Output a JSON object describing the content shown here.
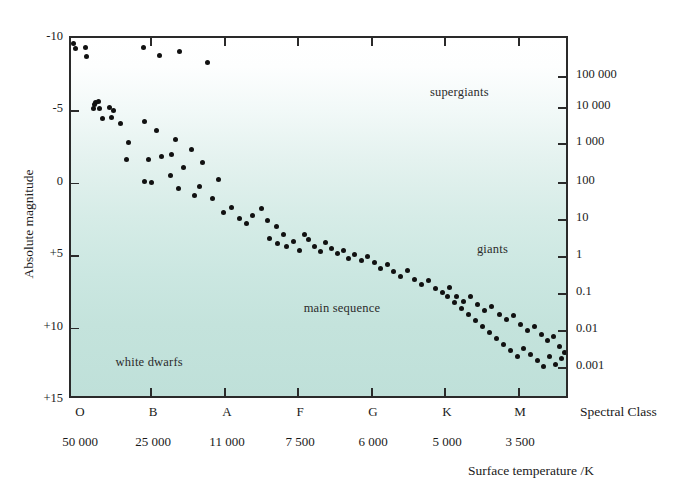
{
  "chart_data": {
    "type": "scatter",
    "xlabel": "Surface temperature /K",
    "x_secondary_label": "Spectral Class",
    "ylabel": "Absolute magnitude",
    "y_secondary_label": "Luminosity relative to the Sun ( × 3.9 × 10²⁶ W)",
    "ylim": [
      -10,
      15
    ],
    "y_axis_inverted": true,
    "grid": false,
    "legend": "none",
    "y_ticks_left": [
      "-10",
      "-5",
      "0",
      "+5",
      "+10",
      "+15"
    ],
    "y_tick_values_left": [
      -10,
      -5,
      0,
      5,
      10,
      15
    ],
    "y_ticks_right": [
      "100 000",
      "10 000",
      "1 000",
      "100",
      "10",
      "1",
      "0.1",
      "0.01",
      "0.001"
    ],
    "y_tick_values_right": [
      100000,
      10000,
      1000,
      100,
      10,
      1,
      0.1,
      0.01,
      0.001
    ],
    "x_ticks_spectral": [
      "O",
      "B",
      "A",
      "F",
      "G",
      "K",
      "M"
    ],
    "x_ticks_temperature": [
      "50 000",
      "25 000",
      "11 000",
      "7 500",
      "6 000",
      "5 000",
      "3 500"
    ],
    "x_tick_temperature_values": [
      50000,
      25000,
      11000,
      7500,
      6000,
      5000,
      3500
    ],
    "annotations": [
      {
        "id": "supergiants",
        "text": "supergiants",
        "x_pct": 72.5,
        "y_pct": 13.0
      },
      {
        "id": "giants",
        "text": "giants",
        "x_pct": 82.0,
        "y_pct": 57.0
      },
      {
        "id": "main-sequence",
        "text": "main sequence",
        "x_pct": 47.0,
        "y_pct": 73.5
      },
      {
        "id": "white-dwarfs",
        "text": "white dwarfs",
        "x_pct": 9.0,
        "y_pct": 88.5
      }
    ],
    "colors": {
      "point": "#111111",
      "frame": "#2a2a2a",
      "background_top": "#ffffff",
      "background_bottom": "#bfe0d9",
      "text": "#1a1a1a"
    },
    "points": [
      [
        1.6,
        5.6
      ],
      [
        4.2,
        10.4
      ],
      [
        14.0,
        9.5
      ],
      [
        15.4,
        18.5
      ],
      [
        72.2,
        9.9
      ],
      [
        88.0,
        17.0
      ],
      [
        108.5,
        13.2
      ],
      [
        136.5,
        24.8
      ],
      [
        24.3,
        64.1
      ],
      [
        22.8,
        70.2
      ],
      [
        28.0,
        70.0
      ],
      [
        23.6,
        66.5
      ],
      [
        27.6,
        63.6
      ],
      [
        38.0,
        69.0
      ],
      [
        42.0,
        72.5
      ],
      [
        31.0,
        80.0
      ],
      [
        40.0,
        79.8
      ],
      [
        49.5,
        85.6
      ],
      [
        73.0,
        83.5
      ],
      [
        85.5,
        92.0
      ],
      [
        104.0,
        101.5
      ],
      [
        100.0,
        116.0
      ],
      [
        57.5,
        104.0
      ],
      [
        55.2,
        121.3
      ],
      [
        77.0,
        121.0
      ],
      [
        90.0,
        118.0
      ],
      [
        120.5,
        111.0
      ],
      [
        131.5,
        124.0
      ],
      [
        112.0,
        129.0
      ],
      [
        99.0,
        137.5
      ],
      [
        80.0,
        144.0
      ],
      [
        73.0,
        143.0
      ],
      [
        107.0,
        150.0
      ],
      [
        123.0,
        157.0
      ],
      [
        128.0,
        148.5
      ],
      [
        147.0,
        141.5
      ],
      [
        141.0,
        160.5
      ],
      [
        152.0,
        174.0
      ],
      [
        160.0,
        169.0
      ],
      [
        168.0,
        180.0
      ],
      [
        175.0,
        185.0
      ],
      [
        181.0,
        177.0
      ],
      [
        190.0,
        170.0
      ],
      [
        196.0,
        182.0
      ],
      [
        205.0,
        188.0
      ],
      [
        212.0,
        196.0
      ],
      [
        198.0,
        200.0
      ],
      [
        206.0,
        205.0
      ],
      [
        215.0,
        208.0
      ],
      [
        222.0,
        203.0
      ],
      [
        228.0,
        212.0
      ],
      [
        233.0,
        196.0
      ],
      [
        237.0,
        201.0
      ],
      [
        243.0,
        208.0
      ],
      [
        249.0,
        213.0
      ],
      [
        254.0,
        204.0
      ],
      [
        260.0,
        210.0
      ],
      [
        266.0,
        215.0
      ],
      [
        272.0,
        212.0
      ],
      [
        277.0,
        220.0
      ],
      [
        283.0,
        216.0
      ],
      [
        290.0,
        222.0
      ],
      [
        296.0,
        218.0
      ],
      [
        303.0,
        224.0
      ],
      [
        309.0,
        230.0
      ],
      [
        316.0,
        226.0
      ],
      [
        322.0,
        233.0
      ],
      [
        329.0,
        238.0
      ],
      [
        336.0,
        232.0
      ],
      [
        343.0,
        241.0
      ],
      [
        350.0,
        246.0
      ],
      [
        357.0,
        242.0
      ],
      [
        364.0,
        250.0
      ],
      [
        371.0,
        254.0
      ],
      [
        378.0,
        249.0
      ],
      [
        385.0,
        258.0
      ],
      [
        392.0,
        263.0
      ],
      [
        399.0,
        258.0
      ],
      [
        406.0,
        266.0
      ],
      [
        413.0,
        272.0
      ],
      [
        420.0,
        268.0
      ],
      [
        428.0,
        276.0
      ],
      [
        435.0,
        281.0
      ],
      [
        442.0,
        277.0
      ],
      [
        449.0,
        286.0
      ],
      [
        456.0,
        292.0
      ],
      [
        463.0,
        288.0
      ],
      [
        470.0,
        296.0
      ],
      [
        476.0,
        302.0
      ],
      [
        482.0,
        298.0
      ],
      [
        488.0,
        308.0
      ],
      [
        493.0,
        314.0
      ],
      [
        497.0,
        305.0
      ],
      [
        490.0,
        320.0
      ],
      [
        484.0,
        326.0
      ],
      [
        478.0,
        318.0
      ],
      [
        472.0,
        328.0
      ],
      [
        466.0,
        322.0
      ],
      [
        459.0,
        316.0
      ],
      [
        452.0,
        310.0
      ],
      [
        446.0,
        318.0
      ],
      [
        439.0,
        312.0
      ],
      [
        432.0,
        306.0
      ],
      [
        425.0,
        300.0
      ],
      [
        418.0,
        294.0
      ],
      [
        411.0,
        288.0
      ],
      [
        404.0,
        282.0
      ],
      [
        397.0,
        276.0
      ],
      [
        390.0,
        270.0
      ],
      [
        383.0,
        264.0
      ],
      [
        376.0,
        258.0
      ]
    ]
  },
  "axes": {
    "left": {
      "title": "Absolute magnitude",
      "ticks": [
        {
          "label": "-10",
          "y": 0
        },
        {
          "label": "-5",
          "y": 72.4
        },
        {
          "label": "0",
          "y": 144.8
        },
        {
          "label": "+5",
          "y": 217.2
        },
        {
          "label": "+10",
          "y": 289.6
        },
        {
          "label": "+15",
          "y": 362
        }
      ]
    },
    "right": {
      "title_parts": {
        "before": "Luminosity relative to the Sun ( × 3.9 × 10",
        "exponent": "26",
        "after": "W)"
      },
      "ticks": [
        {
          "label": "100 000",
          "y": 38
        },
        {
          "label": "10 000",
          "y": 69
        },
        {
          "label": "1 000",
          "y": 105
        },
        {
          "label": "100",
          "y": 144
        },
        {
          "label": "10",
          "y": 181
        },
        {
          "label": "1",
          "y": 218
        },
        {
          "label": "0.1",
          "y": 255
        },
        {
          "label": "0.01",
          "y": 292
        },
        {
          "label": "0.001",
          "y": 329
        }
      ]
    },
    "bottom": {
      "spectral_title": "Spectral Class",
      "temperature_title": "Surface temperature /K",
      "ticks": [
        {
          "spectral": "O",
          "temperature": "50 000",
          "x": 80
        },
        {
          "spectral": "B",
          "temperature": "25 000",
          "x": 153
        },
        {
          "spectral": "A",
          "temperature": "11 000",
          "x": 227
        },
        {
          "spectral": "F",
          "temperature": "7 500",
          "x": 300
        },
        {
          "spectral": "G",
          "temperature": "6 000",
          "x": 373
        },
        {
          "spectral": "K",
          "temperature": "5 000",
          "x": 447
        },
        {
          "spectral": "M",
          "temperature": "3 500",
          "x": 520
        }
      ],
      "frame_tick_x": [
        148,
        222,
        295,
        369,
        442,
        516
      ]
    }
  }
}
